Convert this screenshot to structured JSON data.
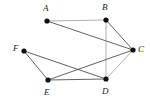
{
  "figure": {
    "kind": "undirected-graph-diagram",
    "width": 150,
    "height": 100,
    "background_color": "#ffffff",
    "vertex_color": "#111111",
    "vertex_radius": 2.6,
    "edge_color_dark": "#3a3a3a",
    "edge_color_light": "#9a9a9a",
    "edge_width": 0.8,
    "label_color": "#1a1a1a"
  },
  "vertices": [
    {
      "id": "A",
      "label": "A",
      "x": 47,
      "y": 21,
      "label_x": 43,
      "label_y": 4,
      "label_pos": "above"
    },
    {
      "id": "B",
      "label": "B",
      "x": 106,
      "y": 20,
      "label_x": 102,
      "label_y": 3,
      "label_pos": "above"
    },
    {
      "id": "C",
      "label": "C",
      "x": 133,
      "y": 50,
      "label_x": 138,
      "label_y": 45,
      "label_pos": "right"
    },
    {
      "id": "D",
      "label": "D",
      "x": 106,
      "y": 79,
      "label_x": 102,
      "label_y": 87,
      "label_pos": "below"
    },
    {
      "id": "E",
      "label": "E",
      "x": 48,
      "y": 80,
      "label_x": 44,
      "label_y": 88,
      "label_pos": "below"
    },
    {
      "id": "F",
      "label": "F",
      "x": 24,
      "y": 51,
      "label_x": 13,
      "label_y": 44,
      "label_pos": "left"
    }
  ],
  "edges": [
    {
      "from": "A",
      "to": "B",
      "shade": "light"
    },
    {
      "from": "A",
      "to": "C",
      "shade": "dark"
    },
    {
      "from": "B",
      "to": "C",
      "shade": "dark"
    },
    {
      "from": "B",
      "to": "D",
      "shade": "light"
    },
    {
      "from": "C",
      "to": "D",
      "shade": "light"
    },
    {
      "from": "C",
      "to": "E",
      "shade": "dark"
    },
    {
      "from": "D",
      "to": "E",
      "shade": "dark"
    },
    {
      "from": "D",
      "to": "F",
      "shade": "dark"
    },
    {
      "from": "E",
      "to": "F",
      "shade": "dark"
    }
  ],
  "counts": {
    "vertex_count": 6,
    "edge_count": 9
  }
}
